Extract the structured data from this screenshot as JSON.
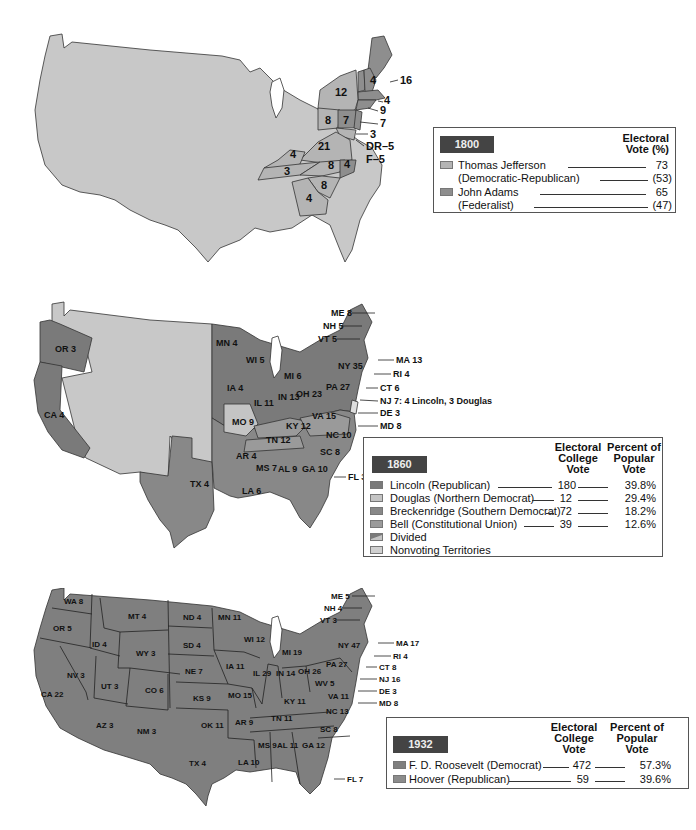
{
  "colors": {
    "nonvoting": "#c8c8c8",
    "jefferson": "#b4b4b4",
    "adams": "#8e8e8e",
    "lincoln": "#7a7a7a",
    "douglas": "#c4c4c4",
    "breckenridge": "#888888",
    "bell": "#9a9a9a",
    "roosevelt": "#7f7f7f",
    "hoover": "#8c8c8c",
    "legend_badge": "#444444"
  },
  "map_1800": {
    "year": "1800",
    "state_labels": [
      "16",
      "4",
      "6",
      "12",
      "4",
      "9",
      "8",
      "7",
      "7",
      "3",
      "DR–5",
      "F–5",
      "21",
      "4",
      "8",
      "4",
      "3",
      "8",
      "4"
    ],
    "legend": {
      "badge": "1800",
      "column_header": "Electoral Vote (%)",
      "column_header_line1": "Electoral",
      "column_header_line2": "Vote (%)",
      "candidates": [
        {
          "name": "Thomas Jefferson",
          "party": "(Democratic-Republican)",
          "electoral": "73",
          "percent": "(53)"
        },
        {
          "name": "John Adams",
          "party": "(Federalist)",
          "electoral": "65",
          "percent": "(47)"
        }
      ]
    }
  },
  "map_1860": {
    "year": "1860",
    "state_labels": {
      "OR": "OR 3",
      "CA": "CA 4",
      "TX": "TX 4",
      "MN": "MN 4",
      "WI": "WI 5",
      "IA": "IA 4",
      "MI": "MI 6",
      "IL": "IL 11",
      "IN": "IN 13",
      "OH": "OH 23",
      "MO": "MO 9",
      "KY": "KY 12",
      "VA": "VA 15",
      "PA": "PA 27",
      "NY": "NY 35",
      "TN": "TN 12",
      "NC": "NC 10",
      "AR": "AR 4",
      "MS": "MS 7",
      "AL": "AL 9",
      "GA": "GA 10",
      "SC": "SC 8",
      "LA": "LA 6",
      "FL": "FL 3",
      "ME": "ME 8",
      "NH": "NH 5",
      "VT": "VT 5",
      "MA": "MA 13",
      "RI": "RI 4",
      "CT": "CT 6",
      "NJ": "NJ 7: 4 Lincoln, 3 Douglas",
      "DE": "DE 3",
      "MD": "MD 8"
    },
    "legend": {
      "badge": "1860",
      "col1_line1": "Electoral",
      "col1_line2": "College",
      "col1_line3": "Vote",
      "col2_line1": "Percent of",
      "col2_line2": "Popular",
      "col2_line3": "Vote",
      "rows": [
        {
          "label": "Lincoln (Republican)",
          "electoral": "180",
          "popular": "39.8%",
          "swatch": "lincoln"
        },
        {
          "label": "Douglas (Northern Democrat)",
          "electoral": "12",
          "popular": "29.4%",
          "swatch": "douglas"
        },
        {
          "label": "Breckenridge (Southern Democrat)",
          "electoral": "72",
          "popular": "18.2%",
          "swatch": "breckenridge"
        },
        {
          "label": "Bell (Constitutional Union)",
          "electoral": "39",
          "popular": "12.6%",
          "swatch": "bell"
        },
        {
          "label": "Divided",
          "electoral": "",
          "popular": "",
          "swatch": "divided"
        },
        {
          "label": "Nonvoting Territories",
          "electoral": "",
          "popular": "",
          "swatch": "nonvoting"
        }
      ]
    }
  },
  "map_1932": {
    "year": "1932",
    "state_labels": {
      "WA": "WA 8",
      "OR": "OR 5",
      "CA": "CA 22",
      "ID": "ID 4",
      "NV": "NV 3",
      "MT": "MT 4",
      "WY": "WY 3",
      "UT": "UT 3",
      "CO": "CO 6",
      "AZ": "AZ 3",
      "NM": "NM 3",
      "ND": "ND 4",
      "SD": "SD 4",
      "NE": "NE 7",
      "KS": "KS 9",
      "OK": "OK 11",
      "TX": "TX 4",
      "MN": "MN 11",
      "IA": "IA 11",
      "MO": "MO 15",
      "AR": "AR 9",
      "LA": "LA 10",
      "WI": "WI 12",
      "IL": "IL 29",
      "MI": "MI 19",
      "IN": "IN 14",
      "OH": "OH 26",
      "KY": "KY 11",
      "TN": "TN 11",
      "MS": "MS 9",
      "AL": "AL 11",
      "GA": "GA 12",
      "FL": "FL 7",
      "SC": "SC 8",
      "NC": "NC 13",
      "VA": "VA 11",
      "WV": "WV 5",
      "PA": "PA 27",
      "NY": "NY 47",
      "ME": "ME 5",
      "NH": "NH 4",
      "VT": "VT 3",
      "MA": "MA 17",
      "RI": "RI 4",
      "CT": "CT 8",
      "NJ": "NJ 16",
      "DE": "DE 3",
      "MD": "MD 8"
    },
    "legend": {
      "badge": "1932",
      "col1_line1": "Electoral",
      "col1_line2": "College",
      "col1_line3": "Vote",
      "col2_line1": "Percent of",
      "col2_line2": "Popular",
      "col2_line3": "Vote",
      "rows": [
        {
          "label": "F. D. Roosevelt (Democrat)",
          "electoral": "472",
          "popular": "57.3%",
          "swatch": "roosevelt"
        },
        {
          "label": "Hoover (Republican)",
          "electoral": "59",
          "popular": "39.6%",
          "swatch": "hoover"
        }
      ]
    }
  }
}
